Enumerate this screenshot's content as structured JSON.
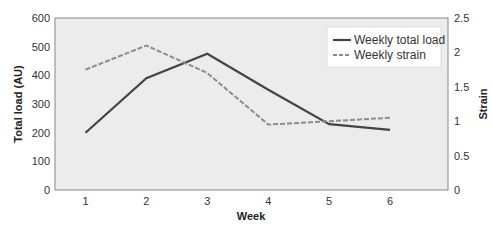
{
  "chart_data": {
    "type": "line",
    "title": "",
    "xlabel": "Week",
    "ylabel": "Total load (AU)",
    "y2label": "Strain",
    "x": [
      1,
      2,
      3,
      4,
      5,
      6
    ],
    "ylim": [
      0,
      600
    ],
    "y2lim": [
      0,
      2.5
    ],
    "yticks": [
      0,
      100,
      200,
      300,
      400,
      500,
      600
    ],
    "y2ticks": [
      "0",
      "0.5",
      "1",
      "1.5",
      "2",
      "2.5"
    ],
    "grid": false,
    "legend_position": "upper right",
    "series": [
      {
        "name": "Weekly total load",
        "axis": "left",
        "style": "solid",
        "color": "#444444",
        "values": [
          200,
          390,
          475,
          350,
          230,
          210
        ]
      },
      {
        "name": "Weekly strain",
        "axis": "right",
        "style": "dashed",
        "color": "#8c8c8c",
        "values": [
          1.75,
          2.1,
          1.7,
          0.95,
          1.0,
          1.05
        ]
      }
    ]
  },
  "colors": {
    "plot_background": "#ececec",
    "axis": "#777777"
  }
}
